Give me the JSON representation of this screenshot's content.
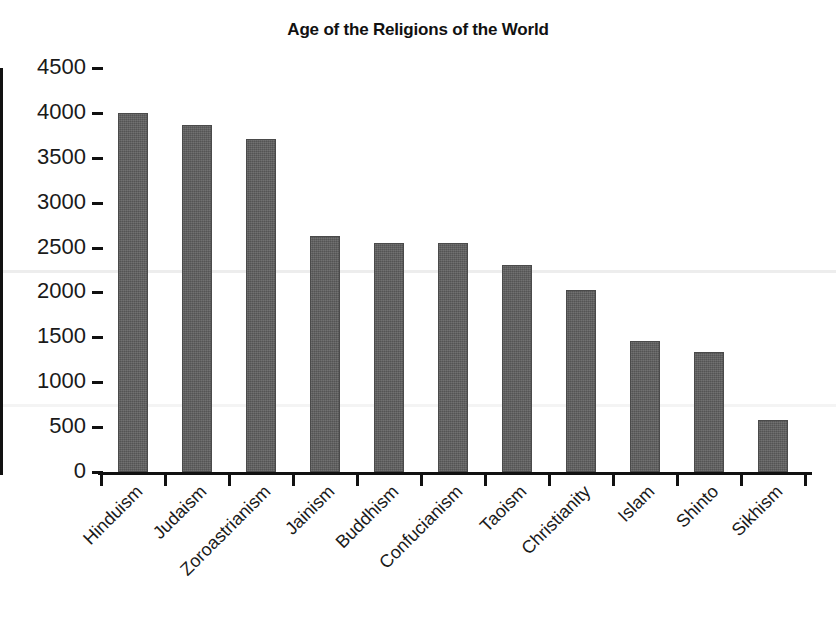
{
  "chart_data": {
    "type": "bar",
    "title": "Age of the Religions of the World",
    "xlabel": "",
    "ylabel": "",
    "categories": [
      "Hinduism",
      "Judaism",
      "Zoroastrianism",
      "Jainism",
      "Buddhism",
      "Confucianism",
      "Taoism",
      "Christianity",
      "Islam",
      "Shinto",
      "Sikhism"
    ],
    "values": [
      4000,
      3865,
      3710,
      2625,
      2555,
      2555,
      2305,
      2025,
      1460,
      1340,
      580
    ],
    "ylim": [
      0,
      4500
    ],
    "yticks": [
      0,
      500,
      1000,
      1500,
      2000,
      2500,
      3000,
      3500,
      4000,
      4500
    ],
    "ytick_labels": [
      "0",
      "500",
      "1000",
      "1500",
      "2000",
      "2500",
      "3000",
      "3500",
      "4000",
      "4500"
    ],
    "grid": false,
    "legend": false,
    "bar_color": "#5c5c5c",
    "axis_color": "#111111",
    "background": "#ffffff",
    "label_rotation": -45
  }
}
